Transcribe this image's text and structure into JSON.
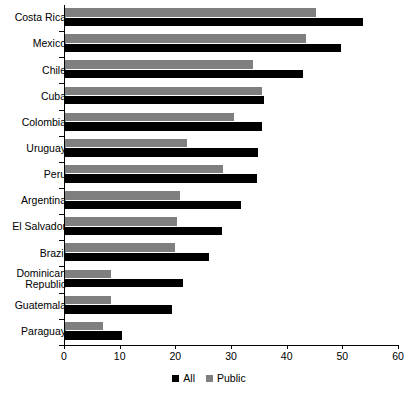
{
  "chart_data": {
    "type": "bar",
    "orientation": "horizontal",
    "title": "",
    "xlabel": "",
    "ylabel": "",
    "xlim": [
      0,
      60
    ],
    "xticks": [
      0,
      10,
      20,
      30,
      40,
      50,
      60
    ],
    "grid": false,
    "legend_position": "bottom-center",
    "categories": [
      "Costa Rica",
      "Mexico",
      "Chile",
      "Cuba",
      "Colombia",
      "Uruguay",
      "Peru",
      "Argentina",
      "El Salvador",
      "Brazil",
      "Dominican\nRepublic",
      "Guatemala",
      "Paraguay"
    ],
    "series": [
      {
        "name": "All",
        "color": "#000000",
        "values": [
          53.5,
          49.6,
          42.8,
          35.8,
          35.4,
          34.7,
          34.5,
          31.7,
          28.2,
          25.9,
          21.2,
          19.2,
          10.2
        ]
      },
      {
        "name": "Public",
        "color": "#7f7f7f",
        "values": [
          45.1,
          43.3,
          33.7,
          35.4,
          30.4,
          22.0,
          28.4,
          20.7,
          20.1,
          19.7,
          8.2,
          8.2,
          6.8
        ]
      }
    ]
  },
  "legend": {
    "items": [
      {
        "label": "All",
        "color": "#000000",
        "swatch_name": "legend-swatch-all"
      },
      {
        "label": "Public",
        "color": "#7f7f7f",
        "swatch_name": "legend-swatch-public"
      }
    ]
  }
}
